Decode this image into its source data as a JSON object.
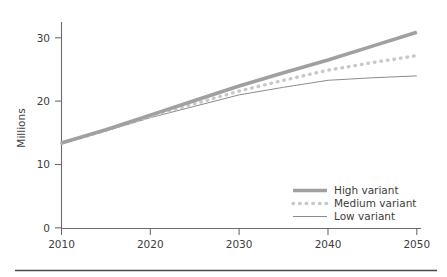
{
  "chart_data": {
    "type": "line",
    "title": "",
    "xlabel": "",
    "ylabel": "Millions",
    "xlim": [
      2010,
      2050
    ],
    "ylim": [
      0,
      32
    ],
    "grid": false,
    "legend_position": "bottom-right",
    "x_ticks": [
      "2010",
      "2020",
      "2030",
      "2040",
      "2050"
    ],
    "y_ticks": [
      "0",
      "10",
      "20",
      "30"
    ],
    "x": [
      2010,
      2015,
      2020,
      2025,
      2030,
      2035,
      2040,
      2045,
      2050
    ],
    "series": [
      {
        "name": "High variant",
        "style": "thick-solid",
        "color": "#a0a0a0",
        "values": [
          13.4,
          15.5,
          17.8,
          20.1,
          22.4,
          24.5,
          26.5,
          28.7,
          30.9
        ]
      },
      {
        "name": "Medium variant",
        "style": "dotted",
        "color": "#c8c8c8",
        "values": [
          13.4,
          15.4,
          17.6,
          19.6,
          21.6,
          23.3,
          24.9,
          26.1,
          27.2
        ]
      },
      {
        "name": "Low variant",
        "style": "thin-solid",
        "color": "#8c8c8c",
        "values": [
          13.4,
          15.3,
          17.4,
          19.2,
          21.0,
          22.2,
          23.3,
          23.7,
          24.0
        ]
      }
    ]
  },
  "axes": {
    "y_axis_title": "Millions",
    "y_tick_labels": [
      "30",
      "20",
      "10",
      "0"
    ],
    "x_tick_labels": [
      "2010",
      "2020",
      "2030",
      "2040",
      "2050"
    ]
  },
  "legend": {
    "entries": [
      {
        "label": "High variant",
        "swatch": "thick-solid-line"
      },
      {
        "label": "Medium variant",
        "swatch": "dotted-line"
      },
      {
        "label": "Low variant",
        "swatch": "thin-solid-line"
      }
    ]
  },
  "footer": {
    "rule": "horizontal-divider"
  },
  "colors": {
    "axis": "#6b6b6b",
    "text": "#3d3d3d",
    "high": "#a0a0a0",
    "medium": "#c8c8c8",
    "low": "#8c8c8c",
    "divider": "#4a4a4a"
  }
}
